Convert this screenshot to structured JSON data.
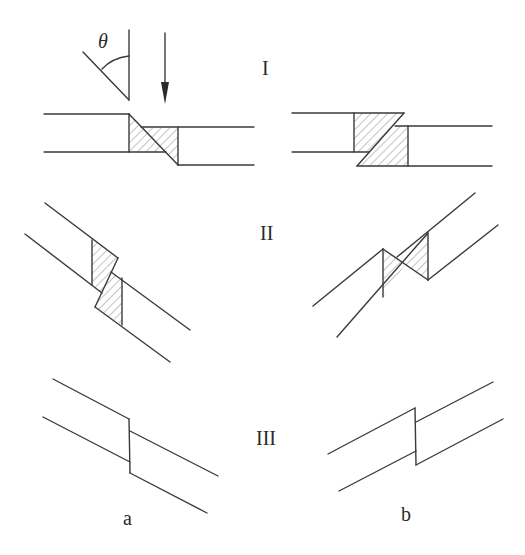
{
  "figure": {
    "type": "diagram",
    "colors": {
      "line": "#3a3a3a",
      "hatch": "#8a8a8a",
      "background": "#ffffff"
    }
  },
  "labels": {
    "stage_1": "I",
    "stage_2": "II",
    "stage_3": "III",
    "case_a": "a",
    "case_b": "b",
    "angle": "θ"
  },
  "legend_icon": {
    "angle_symbol": "angle-theta-icon",
    "arrow": "down-arrow-icon"
  }
}
